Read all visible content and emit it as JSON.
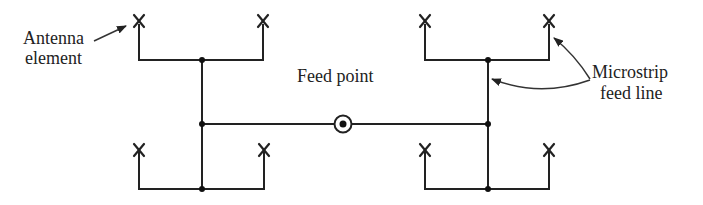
{
  "diagram": {
    "labels": {
      "antenna_line1": "Antenna",
      "antenna_line2": "element",
      "feed_point": "Feed point",
      "microstrip_line1": "Microstrip",
      "microstrip_line2": "feed line"
    },
    "elements": {
      "antenna_symbol": "X",
      "antenna_count": 8,
      "feed_symbol": "circled-dot"
    },
    "colors": {
      "line": "#222222",
      "background": "#ffffff"
    }
  }
}
